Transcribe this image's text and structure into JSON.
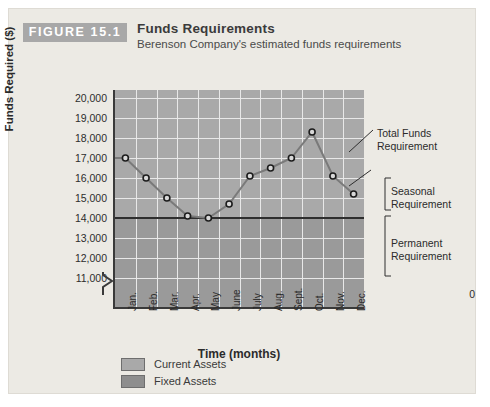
{
  "figure": {
    "badge": "FIGURE 15.1",
    "title": "Funds Requirements",
    "subtitle": "Berenson Company's estimated funds requirements"
  },
  "annotations": {
    "total_funds": "Total Funds\nRequirement",
    "total_funds_line1": "Total Funds",
    "total_funds_line2": "Requirement",
    "seasonal_line1": "Seasonal",
    "seasonal_line2": "Requirement",
    "permanent_line1": "Permanent",
    "permanent_line2": "Requirement"
  },
  "legend": {
    "items": [
      {
        "label": "Current Assets",
        "color": "#a9a9a9"
      },
      {
        "label": "Fixed Assets",
        "color": "#8e8e8e"
      }
    ]
  },
  "colors": {
    "plot_upper": "#a9a9a9",
    "plot_lower": "#9a9a9a",
    "gridline": "#e8e8e8",
    "axis": "#3a3a3a",
    "series_line": "#7a7a7a",
    "marker_edge": "#1c1c1c",
    "permanent_line": "#2e2e2e",
    "badge_bg": "#a8a8a8",
    "card_bg": "#eceae4"
  },
  "chart_data": {
    "type": "line",
    "title": "Funds Requirements",
    "subtitle": "Berenson Company's estimated funds requirements",
    "xlabel": "Time (months)",
    "ylabel": "Funds Required ($)",
    "categories": [
      "Jan.",
      "Feb.",
      "Mar.",
      "Apr.",
      "May",
      "June",
      "July",
      "Aug.",
      "Sept.",
      "Oct.",
      "Nov.",
      "Dec."
    ],
    "values": [
      17000,
      16000,
      15000,
      14100,
      14000,
      14700,
      16100,
      16500,
      17000,
      18300,
      16100,
      15200
    ],
    "series": [
      {
        "name": "Total Funds Requirement",
        "values": [
          17000,
          16000,
          15000,
          14100,
          14000,
          14700,
          16100,
          16500,
          17000,
          18300,
          16100,
          15200
        ]
      }
    ],
    "ylim": [
      11000,
      20000
    ],
    "yticks": [
      11000,
      12000,
      13000,
      14000,
      15000,
      16000,
      17000,
      18000,
      19000,
      20000
    ],
    "ytick_labels": [
      "11,000",
      "12,000",
      "13,000",
      "14,000",
      "15,000",
      "16,000",
      "17,000",
      "18,000",
      "19,000",
      "20,000"
    ],
    "y_axis_zero_label": "0",
    "y_axis_break": true,
    "grid": true,
    "reference_lines": [
      {
        "label": "Permanent Requirement boundary",
        "value": 14000
      }
    ],
    "legend_position": "bottom-left",
    "legend_entries": [
      "Current Assets",
      "Fixed Assets"
    ]
  }
}
